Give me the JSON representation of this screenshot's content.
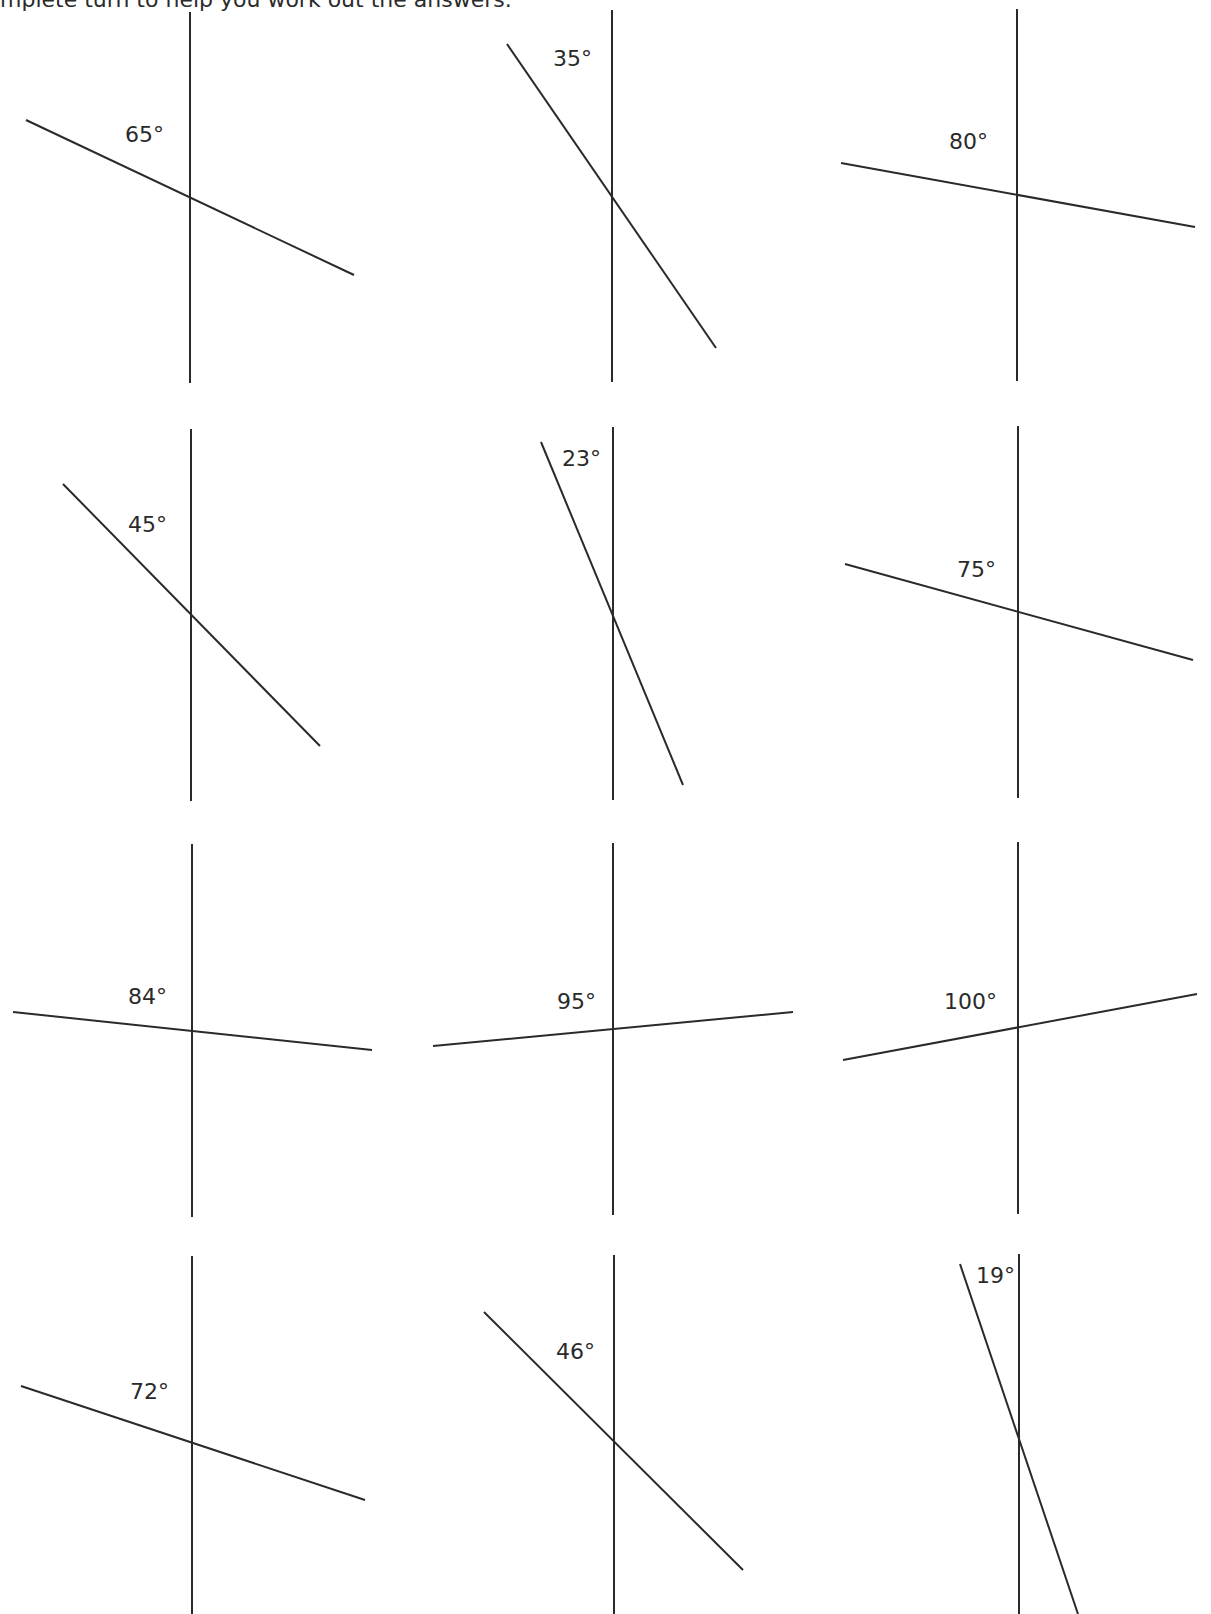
{
  "instruction": "mplete turn to help you work out the answers.",
  "colors": {
    "ink": "#2a2a2a",
    "background": "#ffffff"
  },
  "figures": [
    {
      "label": "65°",
      "vertical": {
        "x": 190,
        "y1": 12,
        "y2": 383
      },
      "slant": {
        "x1": 26,
        "y1": 120,
        "x2": 354,
        "y2": 275
      },
      "label_pos": {
        "x": 125,
        "y": 142
      }
    },
    {
      "label": "35°",
      "vertical": {
        "x": 612,
        "y1": 10,
        "y2": 382
      },
      "slant": {
        "x1": 507,
        "y1": 44,
        "x2": 716,
        "y2": 348
      },
      "label_pos": {
        "x": 553,
        "y": 66
      }
    },
    {
      "label": "80°",
      "vertical": {
        "x": 1017,
        "y1": 9,
        "y2": 381
      },
      "slant": {
        "x1": 841,
        "y1": 163,
        "x2": 1195,
        "y2": 227
      },
      "label_pos": {
        "x": 949,
        "y": 149
      }
    },
    {
      "label": "45°",
      "vertical": {
        "x": 191,
        "y1": 429,
        "y2": 801
      },
      "slant": {
        "x1": 63,
        "y1": 484,
        "x2": 320,
        "y2": 746
      },
      "label_pos": {
        "x": 128,
        "y": 532
      }
    },
    {
      "label": "23°",
      "vertical": {
        "x": 613,
        "y1": 427,
        "y2": 800
      },
      "slant": {
        "x1": 541,
        "y1": 442,
        "x2": 683,
        "y2": 785
      },
      "label_pos": {
        "x": 562,
        "y": 466
      }
    },
    {
      "label": "75°",
      "vertical": {
        "x": 1018,
        "y1": 426,
        "y2": 798
      },
      "slant": {
        "x1": 845,
        "y1": 564,
        "x2": 1193,
        "y2": 660
      },
      "label_pos": {
        "x": 957,
        "y": 577
      }
    },
    {
      "label": "84°",
      "vertical": {
        "x": 192,
        "y1": 844,
        "y2": 1217
      },
      "slant": {
        "x1": 13,
        "y1": 1012,
        "x2": 372,
        "y2": 1050
      },
      "label_pos": {
        "x": 128,
        "y": 1004
      }
    },
    {
      "label": "95°",
      "vertical": {
        "x": 613,
        "y1": 843,
        "y2": 1215
      },
      "slant": {
        "x1": 433,
        "y1": 1046,
        "x2": 793,
        "y2": 1012
      },
      "label_pos": {
        "x": 557,
        "y": 1009
      }
    },
    {
      "label": "100°",
      "vertical": {
        "x": 1018,
        "y1": 842,
        "y2": 1214
      },
      "slant": {
        "x1": 843,
        "y1": 1060,
        "x2": 1197,
        "y2": 994
      },
      "label_pos": {
        "x": 944,
        "y": 1009
      }
    },
    {
      "label": "72°",
      "vertical": {
        "x": 192,
        "y1": 1256,
        "y2": 1614
      },
      "slant": {
        "x1": 21,
        "y1": 1386,
        "x2": 365,
        "y2": 1500
      },
      "label_pos": {
        "x": 130,
        "y": 1399
      }
    },
    {
      "label": "46°",
      "vertical": {
        "x": 614,
        "y1": 1255,
        "y2": 1614
      },
      "slant": {
        "x1": 484,
        "y1": 1312,
        "x2": 743,
        "y2": 1570
      },
      "label_pos": {
        "x": 556,
        "y": 1359
      }
    },
    {
      "label": "19°",
      "vertical": {
        "x": 1019,
        "y1": 1254,
        "y2": 1614
      },
      "slant": {
        "x1": 960,
        "y1": 1264,
        "x2": 1078,
        "y2": 1614
      },
      "label_pos": {
        "x": 976,
        "y": 1283
      }
    }
  ]
}
